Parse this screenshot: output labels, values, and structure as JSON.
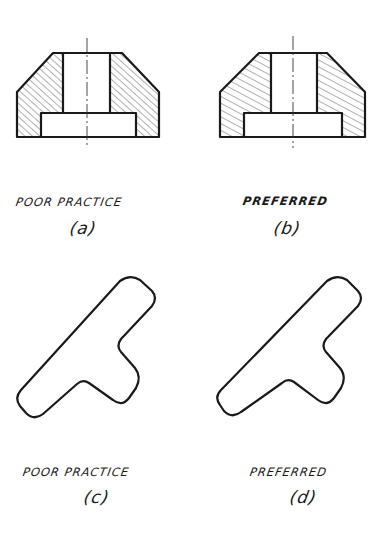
{
  "figure": {
    "panels": [
      {
        "id": "a",
        "caption": "POOR PRACTICE",
        "sub_label": "(a)",
        "description": "Sectioned bushing with counterbore; section lining parallel to chamfer outline"
      },
      {
        "id": "b",
        "caption": "PREFERRED",
        "sub_label": "(b)",
        "description": "Sectioned bushing with counterbore; section lining at angle not parallel to outline"
      },
      {
        "id": "c",
        "caption": "POOR PRACTICE",
        "sub_label": "(c)",
        "description": "T-shaped section; section lining parallel to long edges"
      },
      {
        "id": "d",
        "caption": "PREFERRED",
        "sub_label": "(d)",
        "description": "T-shaped section; section lining at a contrasting angle"
      }
    ],
    "colors": {
      "line": "#1a1a1a",
      "background": "#ffffff"
    }
  }
}
